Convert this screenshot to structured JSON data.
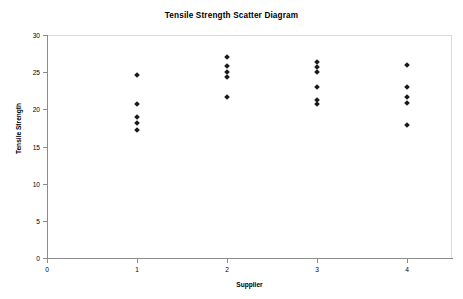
{
  "chart_data": {
    "type": "scatter",
    "title": "Tensile Strength Scatter Diagram",
    "xlabel": "Supplier",
    "ylabel": "Tensile Strength",
    "xlim": [
      0,
      4.5
    ],
    "ylim": [
      0,
      30
    ],
    "x_ticks": [
      0,
      1,
      2,
      3,
      4
    ],
    "x_tick_labels": [
      "0",
      "1",
      "2",
      "3",
      "4"
    ],
    "y_ticks": [
      0,
      5,
      10,
      15,
      20,
      25,
      30
    ],
    "y_tick_labels": [
      "0",
      "5",
      "10",
      "15",
      "20",
      "25",
      "30"
    ],
    "grid": false,
    "legend": "none",
    "marker": "diamond",
    "marker_color": "#1a1a1a",
    "points": [
      {
        "x": 1,
        "y": 24.6
      },
      {
        "x": 1,
        "y": 20.7
      },
      {
        "x": 1,
        "y": 19.0
      },
      {
        "x": 1,
        "y": 18.2
      },
      {
        "x": 1,
        "y": 17.2
      },
      {
        "x": 2,
        "y": 27.0
      },
      {
        "x": 2,
        "y": 25.8
      },
      {
        "x": 2,
        "y": 25.0
      },
      {
        "x": 2,
        "y": 24.3
      },
      {
        "x": 2,
        "y": 21.7
      },
      {
        "x": 3,
        "y": 26.4
      },
      {
        "x": 3,
        "y": 25.7
      },
      {
        "x": 3,
        "y": 25.0
      },
      {
        "x": 3,
        "y": 23.0
      },
      {
        "x": 3,
        "y": 21.3
      },
      {
        "x": 3,
        "y": 20.7
      },
      {
        "x": 4,
        "y": 26.0
      },
      {
        "x": 4,
        "y": 23.0
      },
      {
        "x": 4,
        "y": 21.7
      },
      {
        "x": 4,
        "y": 20.9
      },
      {
        "x": 4,
        "y": 17.9
      }
    ],
    "series": [
      {
        "name": "Tensile Strength",
        "x": [
          1,
          1,
          1,
          1,
          1,
          2,
          2,
          2,
          2,
          2,
          3,
          3,
          3,
          3,
          3,
          3,
          4,
          4,
          4,
          4,
          4
        ],
        "values": [
          24.6,
          20.7,
          19.0,
          18.2,
          17.2,
          27.0,
          25.8,
          25.0,
          24.3,
          21.7,
          26.4,
          25.7,
          25.0,
          23.0,
          21.3,
          20.7,
          26.0,
          23.0,
          21.7,
          20.9,
          17.9
        ]
      }
    ]
  },
  "colors": {
    "background": "#ffffff",
    "axis": "#8c8c8c",
    "frame": "#d9d9d9",
    "text": "#000000",
    "marker": "#1a1a1a"
  }
}
